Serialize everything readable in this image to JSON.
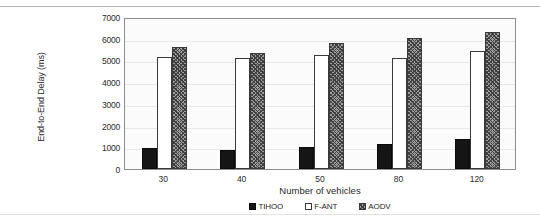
{
  "chart_data": {
    "type": "bar",
    "title": "",
    "xlabel": "Number of vehicles",
    "ylabel": "End-to-End Delay (ms)",
    "categories": [
      "30",
      "40",
      "50",
      "80",
      "120"
    ],
    "series": [
      {
        "name": "TIHOO",
        "values": [
          950,
          880,
          1030,
          1150,
          1400
        ],
        "style": "solid-black"
      },
      {
        "name": "F-ANT",
        "values": [
          5150,
          5120,
          5230,
          5120,
          5420
        ],
        "style": "white-outline"
      },
      {
        "name": "AODV",
        "values": [
          5630,
          5350,
          5800,
          6050,
          6290
        ],
        "style": "diagonal-hatch"
      }
    ],
    "ylim": [
      0,
      7000
    ],
    "yticks": [
      7000,
      6000,
      5000,
      4000,
      3000,
      2000,
      1000,
      0
    ],
    "ytick_labels": [
      "7000",
      "6000",
      "5000",
      "4000",
      "3000",
      "2000",
      "1000",
      "0"
    ],
    "grid": true,
    "legend_position": "bottom",
    "legend_entries": [
      "TIHOO",
      "F-ANT",
      "AODV"
    ],
    "colors": {
      "tihoo": "#151515",
      "fant": "#ffffff",
      "aodv": "#9d9d9d",
      "axis": "#8d8d8d",
      "grid": "#e8e8e8",
      "text": "#2b2b2b",
      "plot_background": "#fbfbfb"
    }
  }
}
